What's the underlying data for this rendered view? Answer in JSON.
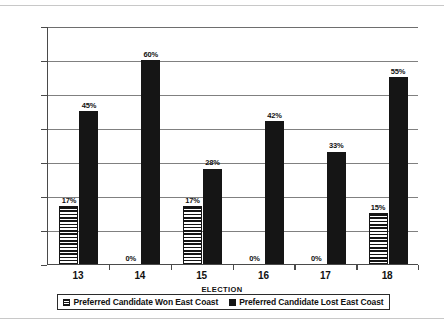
{
  "chart_data": {
    "type": "bar",
    "title": "",
    "xlabel": "ELECTION",
    "ylabel": "",
    "categories": [
      "13",
      "14",
      "15",
      "16",
      "17",
      "18"
    ],
    "ylim": [
      0,
      70
    ],
    "ytick_labels": [
      "0%",
      "10%",
      "20%",
      "30%",
      "40%",
      "50%",
      "60%",
      "70%"
    ],
    "ytick_values": [
      0,
      10,
      20,
      30,
      40,
      50,
      60,
      70
    ],
    "grid": true,
    "legend_position": "bottom",
    "series": [
      {
        "name": "Preferred Candidate Won East Coast",
        "pattern": "horizontal-lines",
        "color": "#151515",
        "values": [
          17,
          0,
          17,
          0,
          0,
          15
        ],
        "data_labels": [
          "17%",
          "0%",
          "17%",
          "0%",
          "0%",
          "15%"
        ]
      },
      {
        "name": "Preferred Candidate Lost East Coast",
        "pattern": "solid",
        "color": "#151515",
        "values": [
          45,
          60,
          28,
          42,
          33,
          55
        ],
        "data_labels": [
          "45%",
          "60%",
          "28%",
          "42%",
          "33%",
          "55%"
        ]
      }
    ]
  },
  "legend": {
    "items": [
      {
        "label": "Preferred Candidate Won East Coast",
        "swatch": "hatched-square-icon"
      },
      {
        "label": "Preferred Candidate Lost East Coast",
        "swatch": "filled-square-icon"
      }
    ]
  },
  "axes": {
    "x_title": "ELECTION"
  }
}
